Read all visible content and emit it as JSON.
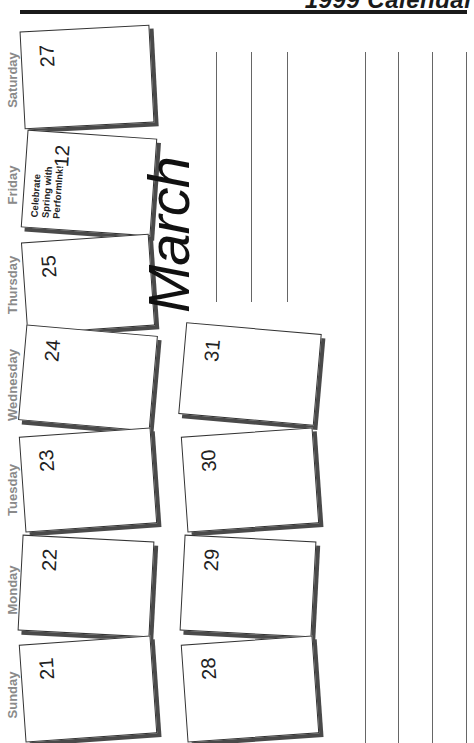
{
  "header": {
    "title": "1999 Calendar"
  },
  "month": "March",
  "day_labels": [
    "Saturday",
    "Friday",
    "Thursday",
    "Wednesday",
    "Tuesday",
    "Monday",
    "Sunday"
  ],
  "cards_week1": [
    {
      "day": "Saturday",
      "date": "27"
    },
    {
      "day": "Friday",
      "date": "12",
      "note": [
        "Celebrate",
        "Spring with",
        "PerformInk!"
      ]
    },
    {
      "day": "Thursday",
      "date": "25"
    },
    {
      "day": "Wednesday",
      "date": "24"
    },
    {
      "day": "Tuesday",
      "date": "23"
    },
    {
      "day": "Monday",
      "date": "22"
    },
    {
      "day": "Sunday",
      "date": "21"
    }
  ],
  "cards_week2": [
    {
      "day": "Wednesday",
      "date": "31"
    },
    {
      "day": "Tuesday",
      "date": "30"
    },
    {
      "day": "Monday",
      "date": "29"
    },
    {
      "day": "Sunday",
      "date": "28"
    }
  ],
  "colors": {
    "ink": "#1a1a1a",
    "label_gray": "#8a8a8a",
    "shadow": "#4a4a4a",
    "line": "#666666"
  }
}
